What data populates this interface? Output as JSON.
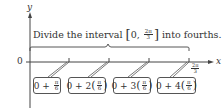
{
  "axes": {
    "y_label": "y",
    "x_label": "x",
    "origin_label": "0",
    "end_label": {
      "numerator": "2π",
      "denominator": "3"
    }
  },
  "caption": {
    "prefix": "Divide the interval",
    "interval_open": "[0,",
    "interval_frac": {
      "numerator": "2π",
      "denominator": "3"
    },
    "interval_close": "]",
    "suffix": "into fourths."
  },
  "boxes": [
    {
      "lead": "0 + ",
      "multiplier": "",
      "numerator": "π",
      "denominator": "6"
    },
    {
      "lead": "0 + 2",
      "multiplier": "2",
      "numerator": "π",
      "denominator": "6"
    },
    {
      "lead": "0 + 3",
      "multiplier": "3",
      "numerator": "π",
      "denominator": "6"
    },
    {
      "lead": "0 + 4",
      "multiplier": "4",
      "numerator": "π",
      "denominator": "6"
    }
  ],
  "colors": {
    "line": "#444444",
    "text": "#333333",
    "background": "#ffffff"
  }
}
